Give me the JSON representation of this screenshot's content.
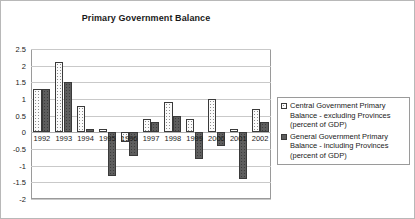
{
  "chart_data": {
    "type": "bar",
    "title": "Primary Government Balance",
    "xlabel": "",
    "ylabel": "",
    "ylim": [
      -2,
      2.5
    ],
    "ytick_values": [
      2.5,
      2,
      1.5,
      1,
      0.5,
      0,
      -0.5,
      -1,
      -1.5,
      -2
    ],
    "ytick_labels": [
      "2.5",
      "2",
      "1.5",
      "1",
      "0.5",
      "0",
      "-0.5",
      "-1",
      "-1.5",
      "-2"
    ],
    "grid": true,
    "legend_position": "right",
    "categories": [
      "1992",
      "1993",
      "1994",
      "1995",
      "1996",
      "1997",
      "1998",
      "1999",
      "2000",
      "2001",
      "2002"
    ],
    "series": [
      {
        "name": "Central Government Primary Balance - excluding Provinces (percent of GDP)",
        "fill": "dotted-light",
        "color": "#fbfbfb",
        "values": [
          1.3,
          2.1,
          0.8,
          0.1,
          -0.3,
          0.4,
          0.9,
          0.4,
          1.0,
          0.1,
          0.7
        ]
      },
      {
        "name": "General Government Primary Balance - including Provinces (percent of GDP)",
        "fill": "solid-dark",
        "color": "#5e5e5e",
        "values": [
          1.3,
          1.5,
          0.1,
          -1.3,
          -0.7,
          0.3,
          0.5,
          -0.8,
          -0.4,
          -1.4,
          0.3
        ]
      }
    ]
  },
  "legend": {
    "entries": [
      {
        "line1": "Central Government Primary Balance -",
        "line2": "excluding Provinces (percent of GDP)"
      },
      {
        "line1": "General Government Primary Balance -",
        "line2": "including Provinces (percent of GDP)"
      }
    ]
  }
}
